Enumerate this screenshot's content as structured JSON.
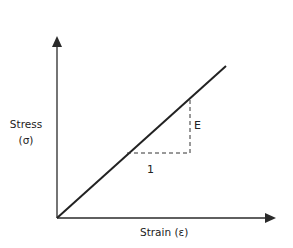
{
  "diagram": {
    "y_axis": {
      "label": "Stress",
      "symbol": "(σ)"
    },
    "x_axis": {
      "label": "Strain (ε)"
    },
    "slope_triangle": {
      "run_label": "1",
      "rise_label": "E"
    },
    "colors": {
      "line": "#222222",
      "dashed": "#333333",
      "background": "#ffffff"
    },
    "geometry": {
      "origin": [
        57,
        218
      ],
      "y_axis_tip": [
        57,
        37
      ],
      "x_axis_tip": [
        276,
        218
      ],
      "line_end": [
        226,
        66
      ],
      "triangle": {
        "corner_on_line": [
          127,
          153
        ],
        "right_angle": [
          190,
          153
        ],
        "top_on_line": [
          190,
          98
        ]
      }
    }
  }
}
